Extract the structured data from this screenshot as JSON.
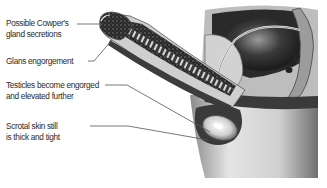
{
  "diagram": {
    "type": "anatomical-illustration",
    "labels": [
      {
        "id": "cowpers",
        "lines": [
          "Possible Cowper's",
          "gland secretions"
        ]
      },
      {
        "id": "glans",
        "lines": [
          "Glans engorgement"
        ]
      },
      {
        "id": "testicles",
        "lines": [
          "Testicles become engorged",
          "and elevated further"
        ]
      },
      {
        "id": "scrotal",
        "lines": [
          "Scrotal skin still",
          "is thick and tight"
        ]
      }
    ],
    "colors": {
      "text": "#2b2b2b",
      "leader_line": "#555555",
      "background": "#ffffff"
    }
  }
}
